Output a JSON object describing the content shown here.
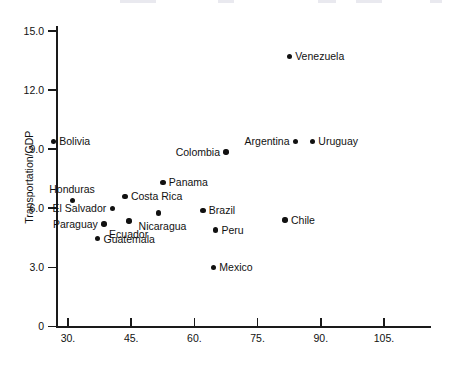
{
  "chart_data": {
    "type": "scatter",
    "title": "",
    "xlabel": "",
    "ylabel": "Transportation/GDP",
    "xlim": [
      24,
      113
    ],
    "ylim": [
      0,
      16
    ],
    "grid": false,
    "legend": false,
    "x_ticks": [
      {
        "value": 30,
        "label": "30."
      },
      {
        "value": 45,
        "label": "45."
      },
      {
        "value": 60,
        "label": "60."
      },
      {
        "value": 75,
        "label": "75."
      },
      {
        "value": 90,
        "label": "90."
      },
      {
        "value": 105,
        "label": "105."
      }
    ],
    "y_ticks": [
      {
        "value": 0,
        "label": "0"
      },
      {
        "value": 3,
        "label": "3.0"
      },
      {
        "value": 6,
        "label": "6.0"
      },
      {
        "value": 9,
        "label": "9.0"
      },
      {
        "value": 12,
        "label": "12.0"
      },
      {
        "value": 15,
        "label": "15.0"
      }
    ],
    "points": [
      {
        "name": "Venezuela",
        "x": 82.5,
        "y": 13.7,
        "label_side": "right"
      },
      {
        "name": "Bolivia",
        "x": 26.5,
        "y": 9.4,
        "label_side": "right"
      },
      {
        "name": "Colombia",
        "x": 67.5,
        "y": 8.85,
        "label_side": "left"
      },
      {
        "name": "Argentina",
        "x": 84.0,
        "y": 9.4,
        "label_side": "left"
      },
      {
        "name": "Uruguay",
        "x": 88.0,
        "y": 9.4,
        "label_side": "right"
      },
      {
        "name": "Panama",
        "x": 52.5,
        "y": 7.3,
        "label_side": "right"
      },
      {
        "name": "Costa Rica",
        "x": 43.5,
        "y": 6.6,
        "label_side": "right"
      },
      {
        "name": "Honduras",
        "x": 31.0,
        "y": 6.4,
        "label_side": "above"
      },
      {
        "name": "El Salvador",
        "x": 40.5,
        "y": 6.0,
        "label_side": "left"
      },
      {
        "name": "Brazil",
        "x": 62.0,
        "y": 5.9,
        "label_side": "right"
      },
      {
        "name": "Chile",
        "x": 81.5,
        "y": 5.4,
        "label_side": "right"
      },
      {
        "name": "Nicaragua",
        "x": 51.5,
        "y": 5.75,
        "label_side": "below"
      },
      {
        "name": "Ecuador",
        "x": 44.5,
        "y": 5.35,
        "label_side": "below"
      },
      {
        "name": "Paraguay",
        "x": 38.5,
        "y": 5.2,
        "label_side": "left"
      },
      {
        "name": "Peru",
        "x": 65.0,
        "y": 4.9,
        "label_side": "right"
      },
      {
        "name": "Guatemala",
        "x": 37.0,
        "y": 4.45,
        "label_side": "right"
      },
      {
        "name": "Mexico",
        "x": 64.5,
        "y": 3.0,
        "label_side": "right"
      }
    ]
  }
}
